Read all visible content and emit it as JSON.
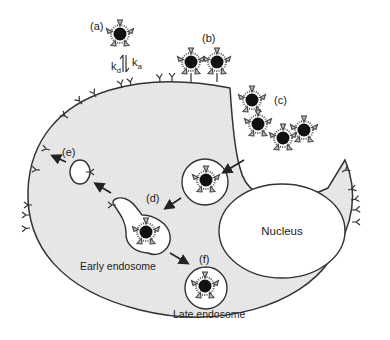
{
  "diagram": {
    "labels": {
      "a": "(a)",
      "b": "(b)",
      "c": "(c)",
      "d": "(d)",
      "e": "(e)",
      "f": "(f)"
    },
    "rate_constants": {
      "dissociation": "k",
      "dissociation_sub": "d",
      "association": "k",
      "association_sub": "a"
    },
    "structures": {
      "nucleus": "Nucleus",
      "early_endosome": "Early endosome",
      "late_endosome": "Late endosome"
    },
    "colors": {
      "cytoplasm": "#e6e6e6",
      "outline": "#333333",
      "particle_core": "#111111",
      "background": "#ffffff"
    }
  }
}
